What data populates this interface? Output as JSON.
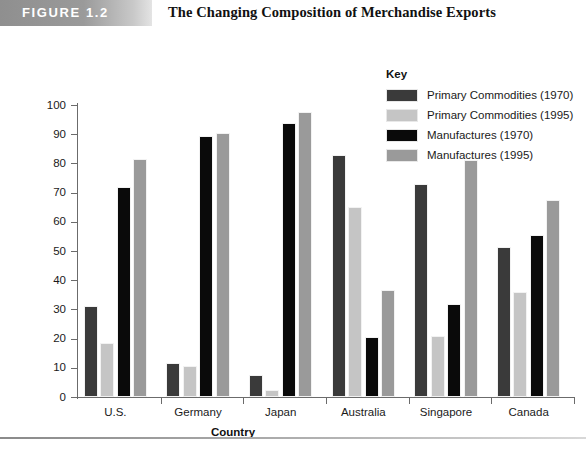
{
  "figure": {
    "banner_label": "FIGURE 1.2",
    "title": "The Changing Composition of Merchandise Exports"
  },
  "legend": {
    "title": "Key",
    "items": [
      {
        "label": "Primary Commodities (1970)",
        "color": "#3a3a3a"
      },
      {
        "label": "Primary Commodities (1995)",
        "color": "#c5c5c5"
      },
      {
        "label": "Manufactures (1970)",
        "color": "#0a0a0a"
      },
      {
        "label": "Manufactures (1995)",
        "color": "#9a9a9a"
      }
    ]
  },
  "axes": {
    "y_ticks": [
      "0",
      "10",
      "20",
      "30",
      "40",
      "50",
      "60",
      "70",
      "80",
      "90",
      "100"
    ],
    "x_title": "Country"
  },
  "footer": {
    "note": ""
  },
  "chart_data": {
    "type": "bar",
    "title": "The Changing Composition of Merchandise Exports",
    "xlabel": "Country",
    "ylabel": "",
    "ylim": [
      0,
      100
    ],
    "ytick_step": 10,
    "grid": false,
    "legend_position": "top-right",
    "categories": [
      "U.S.",
      "Germany",
      "Japan",
      "Australia",
      "Singapore",
      "Canada"
    ],
    "series": [
      {
        "name": "Primary Commodities (1970)",
        "color": "#3a3a3a",
        "values": [
          31,
          11.5,
          7.5,
          83,
          73,
          51.5
        ]
      },
      {
        "name": "Primary Commodities (1995)",
        "color": "#c5c5c5",
        "values": [
          18.5,
          10.5,
          2.5,
          65,
          21,
          36
        ]
      },
      {
        "name": "Manufactures (1970)",
        "color": "#0a0a0a",
        "values": [
          72,
          89.5,
          94,
          20.5,
          32,
          55.5
        ]
      },
      {
        "name": "Manufactures (1995)",
        "color": "#9a9a9a",
        "values": [
          81.5,
          90.5,
          97.5,
          36.5,
          81,
          67.5
        ]
      }
    ]
  }
}
